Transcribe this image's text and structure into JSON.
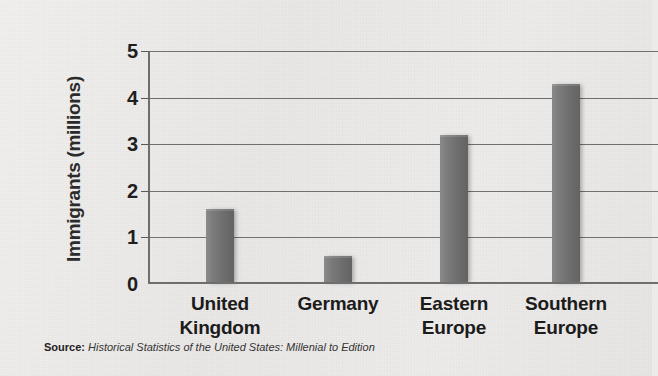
{
  "chart_data": {
    "type": "bar",
    "title": "",
    "xlabel": "",
    "ylabel": "Immigrants (millions)",
    "categories": [
      "United Kingdom",
      "Germany",
      "Eastern Europe",
      "Southern Europe"
    ],
    "category_lines": [
      [
        "United",
        "Kingdom"
      ],
      [
        "Germany",
        ""
      ],
      [
        "Eastern",
        "Europe"
      ],
      [
        "Southern",
        "Europe"
      ]
    ],
    "values": [
      1.6,
      0.6,
      3.2,
      4.3
    ],
    "units": "millions",
    "ylim": [
      0,
      5
    ],
    "ytick_labels": [
      "0",
      "1",
      "2",
      "3",
      "4",
      "5"
    ],
    "ytick_values": [
      0,
      1,
      2,
      3,
      4,
      5
    ],
    "grid": true,
    "grid_axis": "y",
    "legend": false,
    "bar_color": "#6e6e6e",
    "background_color": "#edebe9",
    "axis_color": "#6e6e6e"
  },
  "source": {
    "label": "Source:",
    "text": "Historical Statistics of the United States: Millenial to Edition"
  }
}
